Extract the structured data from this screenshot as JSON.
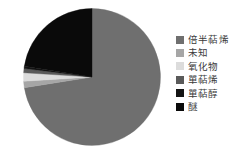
{
  "chart_data": {
    "type": "pie",
    "title": "",
    "subtitle": "",
    "xlabel": "",
    "ylabel": "",
    "grid": false,
    "legend_position": "right",
    "start_angle_deg": 0,
    "direction": "clockwise",
    "categories": [
      "倍半萜烯",
      "未知",
      "氧化物",
      "單萜烯",
      "單萜醇",
      "醚"
    ],
    "values": [
      72.5,
      1.5,
      2.0,
      1.0,
      0.5,
      22.5
    ],
    "colors": [
      "#6f6f6f",
      "#a6a6a6",
      "#dcdcdc",
      "#5a5a5a",
      "#141414",
      "#0a0a0a"
    ],
    "slices": [
      {
        "label": "倍半萜烯",
        "value": 72.5,
        "color": "#6f6f6f"
      },
      {
        "label": "未知",
        "value": 1.5,
        "color": "#a6a6a6"
      },
      {
        "label": "氧化物",
        "value": 2.0,
        "color": "#dcdcdc"
      },
      {
        "label": "單萜烯",
        "value": 1.0,
        "color": "#5a5a5a"
      },
      {
        "label": "單萜醇",
        "value": 0.5,
        "color": "#141414"
      },
      {
        "label": "醚",
        "value": 22.5,
        "color": "#0a0a0a"
      }
    ],
    "annotations": []
  },
  "legend": {
    "items": [
      {
        "label": "倍半萜烯",
        "color": "#6f6f6f"
      },
      {
        "label": "未知",
        "color": "#a6a6a6"
      },
      {
        "label": "氧化物",
        "color": "#dcdcdc"
      },
      {
        "label": "單萜烯",
        "color": "#5a5a5a"
      },
      {
        "label": "單萜醇",
        "color": "#141414"
      },
      {
        "label": "醚",
        "color": "#0a0a0a"
      }
    ]
  },
  "background_color": "#ffffff"
}
